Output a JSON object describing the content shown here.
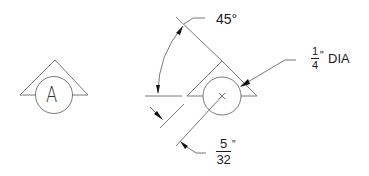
{
  "diagram": {
    "type": "engineering-symbol-detail",
    "left_symbol": {
      "label": "A",
      "shape": "triangle-with-circle"
    },
    "right_symbol": {
      "shape": "triangle-with-circle-center-mark"
    },
    "dimensions": {
      "angle": {
        "value": "45°"
      },
      "diameter": {
        "numerator": "1",
        "denominator": "4",
        "unit_mark": "\"",
        "suffix": "DIA"
      },
      "offset": {
        "numerator": "5",
        "denominator": "32",
        "unit_mark": "\""
      }
    },
    "colors": {
      "line": "#6a6a6a",
      "arrow": "#111111",
      "text": "#1a1a1a",
      "background": "#ffffff"
    }
  }
}
